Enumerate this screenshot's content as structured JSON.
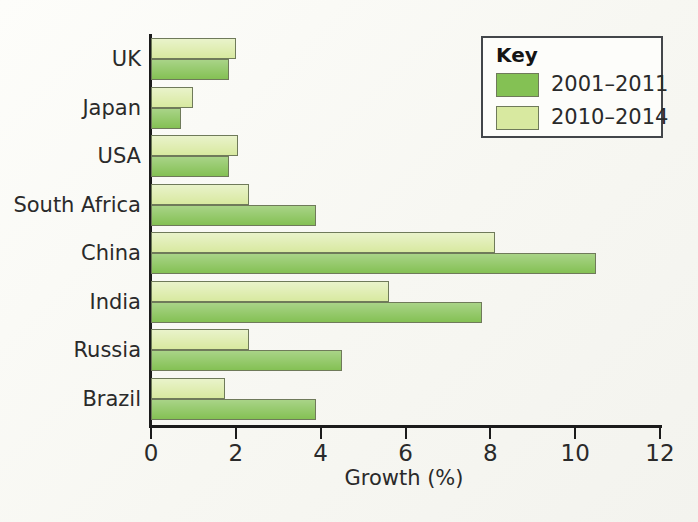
{
  "chart_data": {
    "type": "bar",
    "orientation": "horizontal",
    "title": "",
    "xlabel": "Growth (%)",
    "ylabel": "",
    "xlim": [
      0,
      12
    ],
    "xticks": [
      0,
      2,
      4,
      6,
      8,
      10,
      12
    ],
    "xtick_labels": [
      "0",
      "2",
      "4",
      "6",
      "8",
      "10",
      "12"
    ],
    "grid": false,
    "legend_position": "top-right",
    "legend_title": "Key",
    "categories": [
      "UK",
      "Japan",
      "USA",
      "South Africa",
      "China",
      "India",
      "Russia",
      "Brazil"
    ],
    "series": [
      {
        "name": "2001–2011",
        "color": "#84c154",
        "values": [
          1.85,
          0.7,
          1.85,
          3.9,
          10.5,
          7.8,
          4.5,
          3.9
        ]
      },
      {
        "name": "2010–2014",
        "color": "#d8e9a0",
        "values": [
          2.0,
          1.0,
          2.05,
          2.3,
          8.1,
          5.6,
          2.3,
          1.75
        ]
      }
    ]
  },
  "axis": {
    "x_title": "Growth (%)",
    "tick_labels": [
      "0",
      "2",
      "4",
      "6",
      "8",
      "10",
      "12"
    ],
    "category_labels": [
      "UK",
      "Japan",
      "USA",
      "South Africa",
      "China",
      "India",
      "Russia",
      "Brazil"
    ]
  },
  "legend": {
    "title": "Key",
    "entries": [
      {
        "label": "2001–2011",
        "color": "#84c154"
      },
      {
        "label": "2010–2014",
        "color": "#d8e9a0"
      }
    ]
  }
}
